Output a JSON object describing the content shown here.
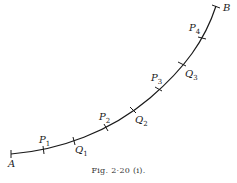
{
  "figure": {
    "caption": "Fig. 2·20 (i).",
    "curve_color": "#1a1a1a",
    "endpoints": [
      {
        "label": "A",
        "x": 11,
        "y": 154
      },
      {
        "label": "B",
        "x": 216,
        "y": 6
      }
    ],
    "points": [
      {
        "letter": "P",
        "sub": "1",
        "x": 43,
        "y": 150
      },
      {
        "letter": "Q",
        "sub": "1",
        "x": 74,
        "y": 141
      },
      {
        "letter": "P",
        "sub": "2",
        "x": 106,
        "y": 128
      },
      {
        "letter": "Q",
        "sub": "2",
        "x": 133,
        "y": 110
      },
      {
        "letter": "P",
        "sub": "3",
        "x": 159,
        "y": 89
      },
      {
        "letter": "Q",
        "sub": "3",
        "x": 182,
        "y": 64
      },
      {
        "letter": "P",
        "sub": "4",
        "x": 202,
        "y": 38
      }
    ]
  }
}
